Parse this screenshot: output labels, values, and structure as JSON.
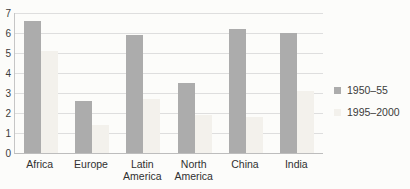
{
  "chart_data": {
    "type": "bar",
    "title": "",
    "xlabel": "",
    "ylabel": "",
    "categories": [
      "Africa",
      "Europe",
      "Latin America",
      "North America",
      "China",
      "India"
    ],
    "series": [
      {
        "name": "1950–55",
        "color": "#acacac",
        "values": [
          6.6,
          2.6,
          5.9,
          3.5,
          6.2,
          6.0
        ]
      },
      {
        "name": "1995–2000",
        "color": "#f3f1ec",
        "values": [
          5.1,
          1.4,
          2.7,
          1.9,
          1.8,
          3.1
        ]
      }
    ],
    "ylim": [
      0,
      7
    ],
    "yticks": [
      0,
      1,
      2,
      3,
      4,
      5,
      6,
      7
    ],
    "grid": true,
    "legend_position": "right"
  },
  "colors": {
    "background": "#fcfcfa",
    "gridline": "#dedede",
    "axis_line": "#c6c6c6",
    "text": "#3b3b3b"
  }
}
